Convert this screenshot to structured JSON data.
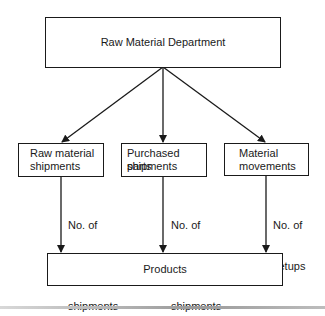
{
  "diagram": {
    "type": "flowchart",
    "root": {
      "label": "Raw Material Department"
    },
    "activities": [
      {
        "label_line1": "Raw material",
        "label_line2": "shipments",
        "driver_lines": [
          "No. of",
          "raw material",
          "shipments"
        ]
      },
      {
        "label_line1": "Purchased parts",
        "label_line2": "shipments",
        "driver_lines": [
          "No. of",
          "purchased parts",
          "shipments"
        ]
      },
      {
        "label_line1": "Material",
        "label_line2": "movements",
        "driver_lines": [
          "No. of",
          "setups"
        ]
      }
    ],
    "target": {
      "label": "Products"
    },
    "colors": {
      "line": "#1a1a1a",
      "background": "#ffffff"
    }
  }
}
